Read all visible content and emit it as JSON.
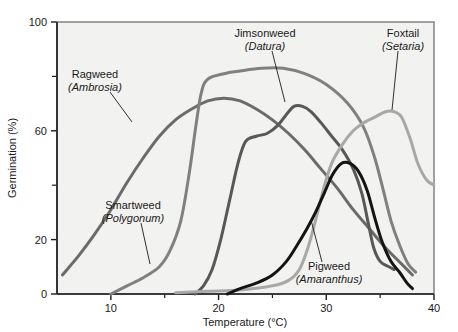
{
  "chart_data": {
    "type": "line",
    "title": "",
    "xlabel": "Temperature (°C)",
    "ylabel": "Germination (%)",
    "xlim": [
      5,
      40
    ],
    "ylim": [
      0,
      100
    ],
    "grid": false,
    "legend_position": "inline-annotations",
    "x_ticks_major": [
      10,
      20,
      30,
      40
    ],
    "x_ticks_minor": [
      15,
      25,
      35
    ],
    "x_tick_labels": [
      "10",
      "20",
      "30",
      "40"
    ],
    "y_ticks_major": [
      0,
      20,
      60,
      100
    ],
    "y_ticks_minor": [
      40,
      80
    ],
    "y_tick_labels": [
      "0",
      "20",
      "60",
      "100"
    ],
    "series": [
      {
        "name": "Ragweed",
        "genus": "Ambrosia",
        "color": "#6b6b6b",
        "label_line1": "Ragweed",
        "label_line2": "(Ambrosia)",
        "points": [
          [
            5.5,
            7
          ],
          [
            7,
            14
          ],
          [
            8.5,
            22
          ],
          [
            10,
            31
          ],
          [
            11.5,
            41
          ],
          [
            13,
            50
          ],
          [
            14.5,
            58
          ],
          [
            16,
            64
          ],
          [
            17.5,
            68
          ],
          [
            19,
            71
          ],
          [
            20.5,
            72
          ],
          [
            22,
            71
          ],
          [
            23.5,
            68
          ],
          [
            25,
            64
          ],
          [
            26.5,
            59
          ],
          [
            28,
            53
          ],
          [
            29.5,
            46
          ],
          [
            31,
            39
          ],
          [
            32.5,
            31
          ],
          [
            34,
            24
          ],
          [
            35.5,
            17
          ],
          [
            37,
            11
          ],
          [
            38,
            7
          ]
        ]
      },
      {
        "name": "Smartweed",
        "genus": "Polygonum",
        "color": "#808080",
        "label_line1": "Smartweed",
        "label_line2": "(Polygonum)",
        "points": [
          [
            10,
            0
          ],
          [
            11.5,
            3
          ],
          [
            13,
            6
          ],
          [
            14.5,
            10
          ],
          [
            15.5,
            16
          ],
          [
            16.5,
            27
          ],
          [
            17.3,
            45
          ],
          [
            17.9,
            62
          ],
          [
            18.4,
            74
          ],
          [
            19,
            79
          ],
          [
            20.5,
            81
          ],
          [
            22,
            82
          ],
          [
            24,
            83
          ],
          [
            26,
            83
          ],
          [
            28,
            81
          ],
          [
            30,
            77
          ],
          [
            32,
            70
          ],
          [
            33.5,
            61
          ],
          [
            34.5,
            50
          ],
          [
            35.3,
            38
          ],
          [
            36,
            27
          ],
          [
            36.8,
            18
          ],
          [
            37.6,
            11
          ],
          [
            38.3,
            8
          ]
        ]
      },
      {
        "name": "Jimsonweed",
        "genus": "Datura",
        "color": "#585858",
        "label_line1": "Jimsonweed",
        "label_line2": "(Datura)",
        "points": [
          [
            17.8,
            0
          ],
          [
            18.6,
            3
          ],
          [
            19.4,
            9
          ],
          [
            20.2,
            20
          ],
          [
            21,
            34
          ],
          [
            21.8,
            48
          ],
          [
            22.5,
            56
          ],
          [
            23.5,
            58
          ],
          [
            24.5,
            59
          ],
          [
            25.5,
            62
          ],
          [
            26.3,
            66
          ],
          [
            27,
            69
          ],
          [
            27.8,
            69
          ],
          [
            28.6,
            67
          ],
          [
            29.5,
            63
          ],
          [
            30.5,
            58
          ],
          [
            31.5,
            53
          ],
          [
            32.5,
            46
          ],
          [
            33.3,
            37
          ],
          [
            33.9,
            26
          ],
          [
            34.4,
            17
          ],
          [
            35,
            12
          ],
          [
            35.8,
            10
          ],
          [
            36.3,
            9
          ]
        ]
      },
      {
        "name": "Foxtail",
        "genus": "Setaria",
        "color": "#a8a8a8",
        "label_line1": "Foxtail",
        "label_line2": "(Setaria)",
        "points": [
          [
            16,
            0.5
          ],
          [
            19,
            1
          ],
          [
            22,
            1.5
          ],
          [
            25,
            3
          ],
          [
            26.5,
            5
          ],
          [
            27.5,
            9
          ],
          [
            28.3,
            17
          ],
          [
            29,
            27
          ],
          [
            29.7,
            38
          ],
          [
            30.5,
            48
          ],
          [
            31.5,
            55
          ],
          [
            32.5,
            60
          ],
          [
            33.5,
            63
          ],
          [
            34.5,
            65
          ],
          [
            35.5,
            67
          ],
          [
            36.3,
            67
          ],
          [
            37,
            65
          ],
          [
            37.8,
            57
          ],
          [
            38.5,
            48
          ],
          [
            39.3,
            42
          ],
          [
            40,
            40
          ]
        ]
      },
      {
        "name": "Pigweed",
        "genus": "Amaranthus",
        "color": "#141414",
        "label_line1": "Pigweed",
        "label_line2": "(Amaranthus)",
        "points": [
          [
            20.8,
            0
          ],
          [
            22,
            2
          ],
          [
            23.5,
            4
          ],
          [
            25,
            7
          ],
          [
            26.3,
            12
          ],
          [
            27.3,
            18
          ],
          [
            28.2,
            24
          ],
          [
            29,
            30
          ],
          [
            29.8,
            37
          ],
          [
            30.6,
            44
          ],
          [
            31.4,
            48
          ],
          [
            32.2,
            48
          ],
          [
            33,
            45
          ],
          [
            33.8,
            38
          ],
          [
            34.5,
            28
          ],
          [
            35.2,
            19
          ],
          [
            36,
            12
          ],
          [
            36.8,
            8
          ],
          [
            37.5,
            4
          ],
          [
            38,
            2
          ]
        ]
      }
    ],
    "annotations": [
      {
        "id": "ragweed",
        "text_x": 95,
        "text_y": 78,
        "anchor": "middle",
        "leader": [
          [
            110,
            92
          ],
          [
            132,
            122
          ]
        ]
      },
      {
        "id": "smartweed",
        "text_x": 133,
        "text_y": 209,
        "anchor": "middle",
        "leader": [
          [
            141,
            223
          ],
          [
            150,
            264
          ]
        ]
      },
      {
        "id": "jimsonweed",
        "text_x": 265,
        "text_y": 37,
        "anchor": "middle",
        "leader": [
          [
            272,
            51
          ],
          [
            285,
            102
          ]
        ]
      },
      {
        "id": "foxtail",
        "text_x": 403,
        "text_y": 37,
        "anchor": "middle",
        "leader": [
          [
            398,
            51
          ],
          [
            392,
            110
          ]
        ]
      },
      {
        "id": "pigweed",
        "text_x": 329,
        "text_y": 270,
        "anchor": "middle",
        "leader": [
          [
            322,
            262
          ],
          [
            311,
            220
          ]
        ]
      }
    ],
    "style": {
      "plot_background": "#f2f2f0",
      "border_color": "#8a8a8a",
      "axis_color": "#1a1a1a",
      "text_color": "#1a1a1a"
    }
  }
}
